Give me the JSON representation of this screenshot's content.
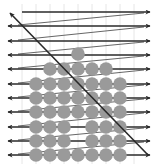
{
  "diagram": {
    "type": "raster-scan-grid",
    "colors": {
      "background": "#ffffff",
      "grid": "#e6e6e6",
      "arrow": "#2a2a2a",
      "return_line": "#555555",
      "circle": "#9a9a9a"
    },
    "rows_y": [
      12,
      26,
      41,
      55,
      69,
      84,
      98,
      112,
      127,
      141,
      155
    ],
    "row_x_start": 8,
    "row_x_end": 150,
    "circle_radius": 6.8,
    "columns_x": [
      36,
      50,
      64,
      78,
      92,
      106,
      120
    ],
    "circle_rows": [
      {
        "y": 54,
        "cols": [
          3
        ]
      },
      {
        "y": 69,
        "cols": [
          1,
          2,
          3,
          4,
          5
        ]
      },
      {
        "y": 84,
        "cols": [
          0,
          1,
          2,
          3,
          4,
          5,
          6
        ]
      },
      {
        "y": 98,
        "cols": [
          0,
          1,
          2,
          3,
          4,
          5,
          6
        ]
      },
      {
        "y": 112,
        "cols": [
          0,
          1,
          2,
          3,
          4,
          5,
          6
        ]
      },
      {
        "y": 127,
        "cols": [
          0,
          1,
          2,
          4,
          5,
          6
        ]
      },
      {
        "y": 141,
        "cols": [
          0,
          1,
          2,
          4,
          5,
          6
        ]
      },
      {
        "y": 155,
        "cols": [
          0,
          1,
          2,
          3,
          4,
          5,
          6
        ]
      }
    ],
    "main_diagonal": {
      "from": [
        148,
        155
      ],
      "to": [
        10,
        13
      ]
    },
    "grid_x": [
      22,
      36,
      50,
      64,
      78,
      92,
      106,
      120,
      134
    ]
  }
}
